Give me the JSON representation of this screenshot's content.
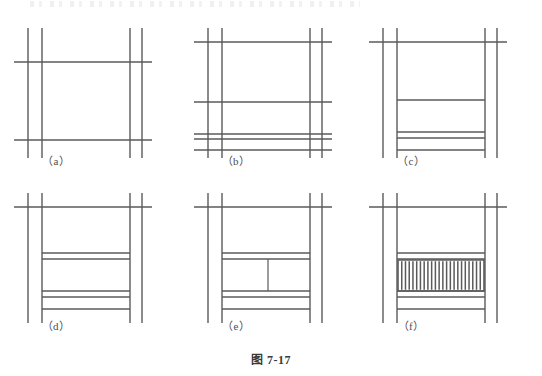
{
  "figure": {
    "caption": "图 7-17",
    "panel_labels": [
      "（a）",
      "（b）",
      "（c）",
      "（d）",
      "（e）",
      "（f）"
    ],
    "line_color": "#5a5a5a",
    "line_color_light": "#7a7a7a",
    "background": "#ffffff",
    "panels": [
      {
        "id": "a",
        "label": "（a）",
        "origin": {
          "x": 0,
          "y": 10
        },
        "posts": {
          "left": [
            28,
            42
          ],
          "right": [
            130,
            142
          ]
        },
        "post_top": 18,
        "post_bottom": 148,
        "rails": [
          {
            "y": 52,
            "x1": 14,
            "x2": 152,
            "weight": 1.4
          },
          {
            "y": 130,
            "x1": 14,
            "x2": 152,
            "weight": 1.4
          }
        ],
        "verticals_extra": [],
        "balusters": 0,
        "label_pos": {
          "x": 56,
          "y": 150
        }
      },
      {
        "id": "b",
        "label": "（b）",
        "origin": {
          "x": 180,
          "y": 10
        },
        "posts": {
          "left": [
            28,
            42
          ],
          "right": [
            130,
            142
          ]
        },
        "post_top": 18,
        "post_bottom": 148,
        "rails": [
          {
            "y": 32,
            "x1": 14,
            "x2": 152,
            "weight": 1.4
          },
          {
            "y": 92,
            "x1": 14,
            "x2": 152,
            "weight": 1.4
          },
          {
            "y": 124,
            "x1": 14,
            "x2": 152,
            "weight": 1.4
          },
          {
            "y": 129,
            "x1": 14,
            "x2": 152,
            "weight": 1.4
          },
          {
            "y": 140,
            "x1": 14,
            "x2": 152,
            "weight": 1.4
          }
        ],
        "verticals_extra": [],
        "balusters": 0,
        "label_pos": {
          "x": 56,
          "y": 150
        }
      },
      {
        "id": "c",
        "label": "（c）",
        "origin": {
          "x": 355,
          "y": 10
        },
        "posts": {
          "left": [
            28,
            42
          ],
          "right": [
            130,
            142
          ]
        },
        "post_top": 18,
        "post_bottom": 148,
        "rails": [
          {
            "y": 32,
            "x1": 14,
            "x2": 152,
            "weight": 1.4
          },
          {
            "y": 90,
            "x1": 42,
            "x2": 130,
            "weight": 1.4
          },
          {
            "y": 122,
            "x1": 42,
            "x2": 130,
            "weight": 1.4
          },
          {
            "y": 128,
            "x1": 42,
            "x2": 130,
            "weight": 1.4
          },
          {
            "y": 140,
            "x1": 42,
            "x2": 130,
            "weight": 1.4
          }
        ],
        "verticals_extra": [],
        "balusters": 0,
        "label_pos": {
          "x": 56,
          "y": 150
        }
      },
      {
        "id": "d",
        "label": "（d）",
        "origin": {
          "x": 0,
          "y": 175
        },
        "posts": {
          "left": [
            28,
            42
          ],
          "right": [
            130,
            142
          ]
        },
        "post_top": 18,
        "post_bottom": 148,
        "rails": [
          {
            "y": 32,
            "x1": 14,
            "x2": 152,
            "weight": 1.4
          },
          {
            "y": 78,
            "x1": 42,
            "x2": 130,
            "weight": 1.4
          },
          {
            "y": 84,
            "x1": 42,
            "x2": 130,
            "weight": 1.4
          },
          {
            "y": 116,
            "x1": 42,
            "x2": 130,
            "weight": 1.4
          },
          {
            "y": 122,
            "x1": 42,
            "x2": 130,
            "weight": 1.4
          },
          {
            "y": 134,
            "x1": 42,
            "x2": 130,
            "weight": 1.4
          }
        ],
        "verticals_extra": [],
        "balusters": 0,
        "label_pos": {
          "x": 56,
          "y": 150
        }
      },
      {
        "id": "e",
        "label": "（e）",
        "origin": {
          "x": 180,
          "y": 175
        },
        "posts": {
          "left": [
            28,
            42
          ],
          "right": [
            130,
            142
          ]
        },
        "post_top": 18,
        "post_bottom": 148,
        "rails": [
          {
            "y": 32,
            "x1": 14,
            "x2": 152,
            "weight": 1.4
          },
          {
            "y": 78,
            "x1": 42,
            "x2": 130,
            "weight": 1.4
          },
          {
            "y": 84,
            "x1": 42,
            "x2": 130,
            "weight": 1.4
          },
          {
            "y": 116,
            "x1": 42,
            "x2": 130,
            "weight": 1.4
          },
          {
            "y": 122,
            "x1": 42,
            "x2": 130,
            "weight": 1.4
          },
          {
            "y": 134,
            "x1": 42,
            "x2": 130,
            "weight": 1.4
          }
        ],
        "verticals_extra": [
          {
            "x": 88,
            "y1": 84,
            "y2": 116,
            "weight": 1.2
          }
        ],
        "balusters": 0,
        "label_pos": {
          "x": 56,
          "y": 150
        }
      },
      {
        "id": "f",
        "label": "（f）",
        "origin": {
          "x": 355,
          "y": 175
        },
        "posts": {
          "left": [
            28,
            42
          ],
          "right": [
            130,
            142
          ]
        },
        "post_top": 18,
        "post_bottom": 148,
        "rails": [
          {
            "y": 32,
            "x1": 14,
            "x2": 152,
            "weight": 1.4
          },
          {
            "y": 78,
            "x1": 42,
            "x2": 130,
            "weight": 1.4
          },
          {
            "y": 84,
            "x1": 42,
            "x2": 130,
            "weight": 1.4
          },
          {
            "y": 116,
            "x1": 42,
            "x2": 130,
            "weight": 1.4
          },
          {
            "y": 122,
            "x1": 42,
            "x2": 130,
            "weight": 1.4
          },
          {
            "y": 134,
            "x1": 42,
            "x2": 130,
            "weight": 1.4
          }
        ],
        "verticals_extra": [],
        "balusters": 22,
        "baluster_zone": {
          "x1": 43,
          "x2": 129,
          "y1": 85,
          "y2": 116
        },
        "label_pos": {
          "x": 56,
          "y": 150
        }
      }
    ],
    "caption_pos": {
      "y": 348
    }
  }
}
